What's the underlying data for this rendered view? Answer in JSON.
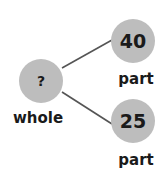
{
  "diagram": {
    "type": "part-whole-model",
    "colors": {
      "circle_fill": "#bdbdbd",
      "line": "#555555",
      "text": "#1a1a1a",
      "background": "#ffffff"
    },
    "whole": {
      "value": "?",
      "label": "whole"
    },
    "parts": [
      {
        "value": "40",
        "label": "part"
      },
      {
        "value": "25",
        "label": "part"
      }
    ]
  }
}
